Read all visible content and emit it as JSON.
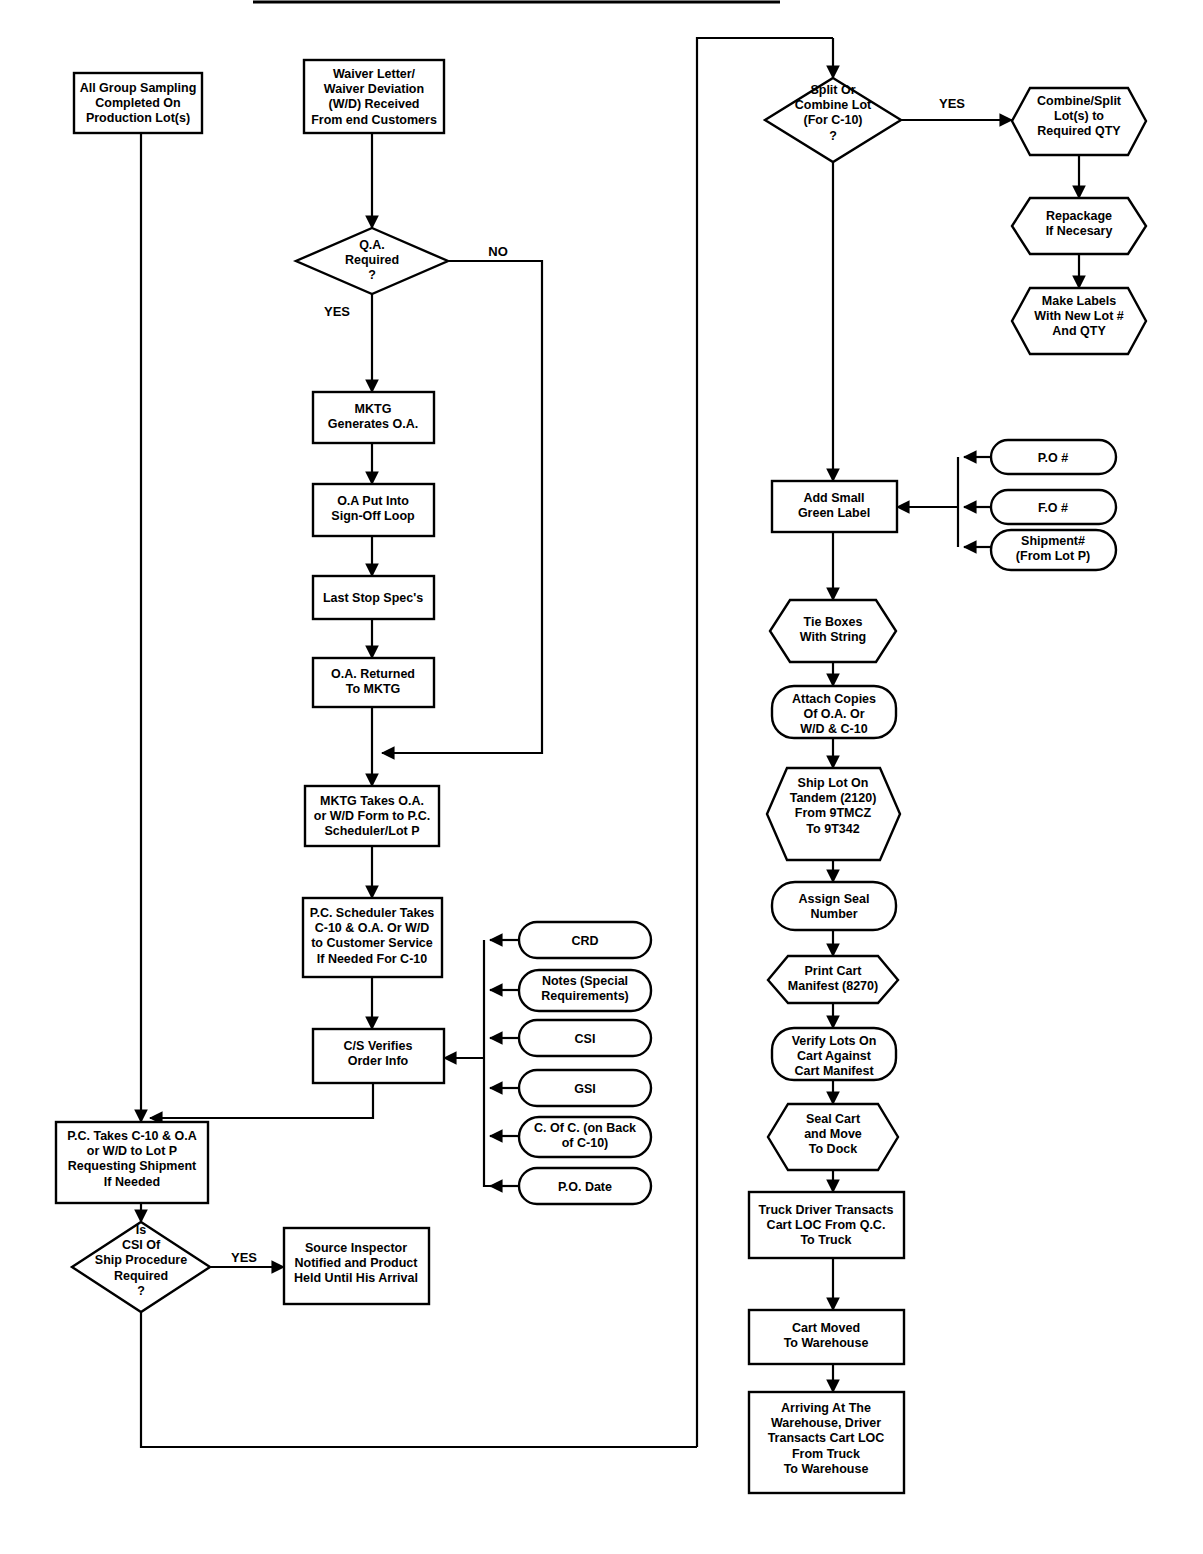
{
  "diagram": {
    "type": "flowchart",
    "colors": {
      "stroke": "#000000",
      "fill": "#ffffff",
      "text": "#000000"
    },
    "edge_labels": {
      "yes": "YES",
      "no": "NO"
    },
    "nodes": {
      "all_group_sampling": "All Group Sampling\nCompleted On\nProduction Lot(s)",
      "waiver_letter": "Waiver Letter/\nWaiver Deviation\n(W/D) Received\nFrom end Customers",
      "qa_required": "Q.A.\nRequired\n?",
      "mktg_generates_oa": "MKTG\nGenerates O.A.",
      "oa_signoff_loop": "O.A Put Into\nSign-Off Loop",
      "last_stop_specs": "Last Stop Spec's",
      "oa_returned": "O.A. Returned\nTo  MKTG",
      "mktg_takes_oa": "MKTG Takes O.A.\nor W/D Form to P.C.\nScheduler/Lot P",
      "pc_scheduler_takes": "P.C. Scheduler Takes\nC-10 & O.A. Or W/D\nto Customer Service\nIf Needed For C-10",
      "cs_verifies": "C/S Verifies\nOrder Info",
      "pc_takes_c10": "P.C. Takes C-10 & O.A\nor W/D to Lot P\nRequesting  Shipment\nIf Needed",
      "csi_ship_procedure": "Is\nCSI Of\nShip Procedure\nRequired\n?",
      "source_inspector": "Source Inspector\nNotified and Product\nHeld Until His Arrival",
      "split_or_combine": "Split Or\nCombine Lot\n(For C-10)\n?",
      "combine_split_lots": "Combine/Split\nLot(s) to\nRequired QTY",
      "repackage": "Repackage\nIf Necesary",
      "make_labels": "Make Labels\nWith New Lot #\nAnd QTY",
      "add_small_green_label": "Add Small\nGreen Label",
      "tie_boxes": "Tie Boxes\nWith String",
      "attach_copies": "Attach Copies\nOf O.A. Or\nW/D & C-10",
      "ship_lot_tandem": "Ship Lot On\nTandem (2120)\nFrom 9TMCZ\nTo 9T342",
      "assign_seal": "Assign Seal\nNumber",
      "print_cart_manifest": "Print Cart\nManifest (8270)",
      "verify_lots": "Verify Lots On\nCart Against\nCart Manifest",
      "seal_cart": "Seal Cart\nand  Move\nTo Dock",
      "truck_driver_transacts": "Truck Driver Transacts\nCart LOC From Q.C.\nTo   Truck",
      "cart_moved": "Cart Moved\nTo Warehouse",
      "arriving_warehouse": "Arriving At The\nWarehouse, Driver\nTransacts Cart LOC\nFrom Truck\nTo Warehouse"
    },
    "order_info_inputs": [
      "CRD",
      "Notes (Special\nRequirements)",
      "CSI",
      "GSI",
      "C. Of C. (on Back\nof C-10)",
      "P.O. Date"
    ],
    "green_label_inputs": [
      "P.O #",
      "F.O #",
      "Shipment#\n(From Lot P)"
    ]
  }
}
